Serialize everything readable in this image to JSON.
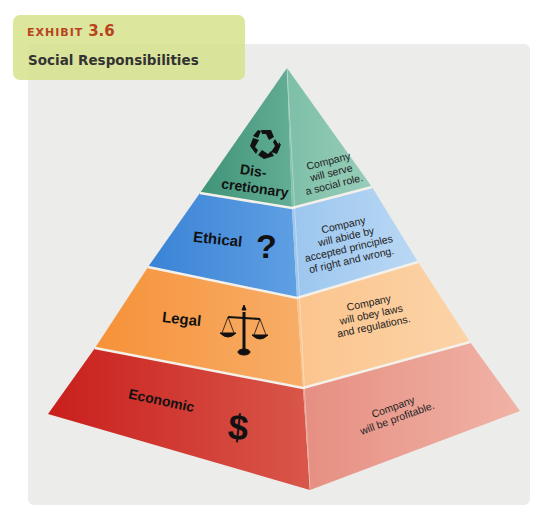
{
  "header": {
    "exhibit_label": "EXHIBIT",
    "exhibit_number": "3.6",
    "title": "Social Responsibilities"
  },
  "colors": {
    "exhibit_text": "#b8431e",
    "label_box": "#d6e28c",
    "card_bg": "#ececea",
    "discretionary_left": "#4e9f85",
    "discretionary_right": "#7fc0aa",
    "ethical_left": "#3d87d8",
    "ethical_right": "#a8cdf0",
    "legal_left": "#f59a45",
    "legal_right": "#fbc895",
    "economic_left": "#cc2a24",
    "economic_right": "#eba092"
  },
  "pyramid": {
    "levels": [
      {
        "id": "discretionary",
        "name_line1": "Dis-",
        "name_line2": "cretionary",
        "icon": "recycle-icon",
        "desc_lines": [
          "Company",
          "will serve",
          "a social role."
        ]
      },
      {
        "id": "ethical",
        "name": "Ethical",
        "icon": "question-mark-icon",
        "icon_glyph": "?",
        "desc_lines": [
          "Company",
          "will abide by",
          "accepted principles",
          "of right and wrong."
        ]
      },
      {
        "id": "legal",
        "name": "Legal",
        "icon": "scales-of-justice-icon",
        "desc_lines": [
          "Company",
          "will obey laws",
          "and regulations."
        ]
      },
      {
        "id": "economic",
        "name": "Economic",
        "icon": "dollar-sign-icon",
        "icon_glyph": "$",
        "desc_lines": [
          "Company",
          "will be profitable."
        ]
      }
    ]
  }
}
